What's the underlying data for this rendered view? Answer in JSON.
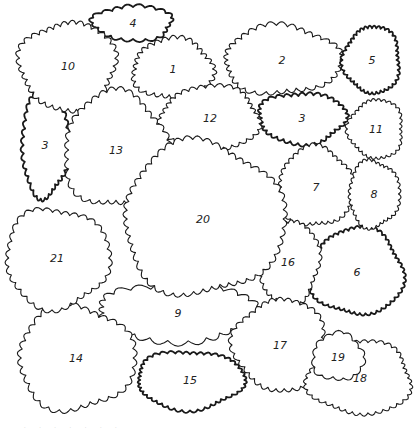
{
  "colors": {
    "line": "#1a1a1a",
    "background": "#ffffff"
  },
  "shrubs": [
    {
      "label": "1",
      "cx": 173,
      "cy": 69,
      "rx": 38,
      "ry": 28,
      "amp": 4,
      "n": 30,
      "bold": false
    },
    {
      "label": "2",
      "cx": 282,
      "cy": 60,
      "rx": 56,
      "ry": 32,
      "amp": 4,
      "n": 34,
      "bold": false
    },
    {
      "label": "3",
      "cx": 45,
      "cy": 145,
      "rx": 22,
      "ry": 50,
      "amp": 3,
      "n": 36,
      "bold": true
    },
    {
      "label": "3",
      "cx": 302,
      "cy": 118,
      "rx": 42,
      "ry": 24,
      "amp": 3,
      "n": 34,
      "bold": true
    },
    {
      "label": "4",
      "cx": 133,
      "cy": 23,
      "rx": 38,
      "ry": 16,
      "amp": 3,
      "n": 20,
      "bold": true
    },
    {
      "label": "5",
      "cx": 372,
      "cy": 60,
      "rx": 27,
      "ry": 32,
      "amp": 2.5,
      "n": 40,
      "bold": true
    },
    {
      "label": "6",
      "cx": 357,
      "cy": 272,
      "rx": 45,
      "ry": 42,
      "amp": 2.5,
      "n": 50,
      "bold": true
    },
    {
      "label": "7",
      "cx": 316,
      "cy": 187,
      "rx": 36,
      "ry": 38,
      "amp": 3,
      "n": 36,
      "bold": false
    },
    {
      "label": "8",
      "cx": 374,
      "cy": 194,
      "rx": 24,
      "ry": 32,
      "amp": 2.5,
      "n": 34,
      "bold": false
    },
    {
      "label": "9",
      "cx": 178,
      "cy": 313,
      "rx": 78,
      "ry": 26,
      "amp": 5,
      "n": 26,
      "bold": false
    },
    {
      "label": "10",
      "cx": 68,
      "cy": 66,
      "rx": 46,
      "ry": 42,
      "amp": 4,
      "n": 36,
      "bold": false
    },
    {
      "label": "11",
      "cx": 376,
      "cy": 129,
      "rx": 26,
      "ry": 28,
      "amp": 2.5,
      "n": 32,
      "bold": false
    },
    {
      "label": "12",
      "cx": 210,
      "cy": 118,
      "rx": 48,
      "ry": 30,
      "amp": 3.5,
      "n": 34,
      "bold": false
    },
    {
      "label": "13",
      "cx": 116,
      "cy": 150,
      "rx": 50,
      "ry": 55,
      "amp": 4,
      "n": 36,
      "bold": false
    },
    {
      "label": "14",
      "cx": 76,
      "cy": 358,
      "rx": 56,
      "ry": 50,
      "amp": 4,
      "n": 34,
      "bold": false
    },
    {
      "label": "15",
      "cx": 190,
      "cy": 380,
      "rx": 52,
      "ry": 28,
      "amp": 2.5,
      "n": 44,
      "bold": true
    },
    {
      "label": "16",
      "cx": 288,
      "cy": 262,
      "rx": 30,
      "ry": 40,
      "amp": 3,
      "n": 32,
      "bold": false
    },
    {
      "label": "17",
      "cx": 280,
      "cy": 345,
      "rx": 44,
      "ry": 44,
      "amp": 3.5,
      "n": 34,
      "bold": false
    },
    {
      "label": "18",
      "cx": 360,
      "cy": 378,
      "rx": 50,
      "ry": 35,
      "amp": 3,
      "n": 40,
      "bold": false
    },
    {
      "label": "19",
      "cx": 338,
      "cy": 357,
      "rx": 24,
      "ry": 22,
      "amp": 3,
      "n": 14,
      "bold": false
    },
    {
      "label": "20",
      "cx": 203,
      "cy": 219,
      "rx": 78,
      "ry": 74,
      "amp": 4,
      "n": 52,
      "bold": false
    },
    {
      "label": "21",
      "cx": 57,
      "cy": 258,
      "rx": 50,
      "ry": 48,
      "amp": 3.5,
      "n": 34,
      "bold": false
    }
  ],
  "caption": "· · · · · · ·"
}
